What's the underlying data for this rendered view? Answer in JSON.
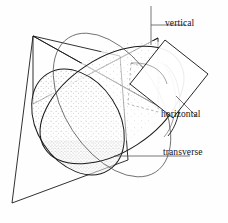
{
  "figure": {
    "title_fragment": "",
    "background_color": "#fefefe",
    "ink_color": "#1a1a1a",
    "stipple_color": "#8a8a8a",
    "labels": [
      {
        "id": "vertical",
        "text": "vertical",
        "leader": "horizontal-line-left"
      },
      {
        "id": "horizontal",
        "text": "horizontal",
        "leader": "diagonal-line-upper-left"
      },
      {
        "id": "transverse",
        "text": "transverse",
        "leader": "horizontal-line-left"
      }
    ],
    "planes": [
      {
        "id": "vertical-plane",
        "shape": "bowtie-quadrilateral",
        "label": "vertical"
      },
      {
        "id": "horizontal-plane",
        "shape": "tilted-rectangle",
        "label": "horizontal"
      },
      {
        "id": "transverse-plane",
        "shape": "large-parallelogram",
        "label": "transverse"
      }
    ],
    "body": {
      "id": "ellipsoid",
      "shape": "prolate-spheroid",
      "fill": "stippled",
      "orientation": "tilted-diagonal-lower-left-to-upper-right"
    }
  }
}
